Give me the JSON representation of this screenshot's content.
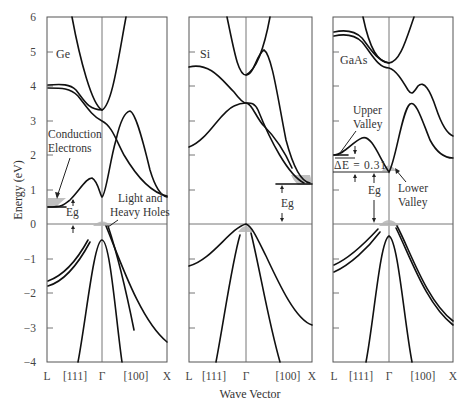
{
  "figure": {
    "y_axis_label": "Energy (eV)",
    "x_axis_label": "Wave Vector",
    "y_ticks": [
      "6",
      "5",
      "4",
      "3",
      "2",
      "1",
      "0",
      "−1",
      "−2",
      "−3",
      "−4"
    ],
    "panels": [
      {
        "material": "Ge",
        "x_ticks": [
          "L",
          "[111]",
          "Γ",
          "[100]",
          "X"
        ],
        "annotations": {
          "conduction_1": "Conduction",
          "conduction_2": "Electrons",
          "holes_1": "Light and",
          "holes_2": "Heavy Holes",
          "gap": "Eg"
        }
      },
      {
        "material": "Si",
        "x_ticks": [
          "L",
          "[111]",
          "Γ",
          "[100]",
          "X"
        ],
        "annotations": {
          "gap": "Eg"
        }
      },
      {
        "material": "GaAs",
        "x_ticks": [
          "L",
          "[111]",
          "Γ",
          "[100]",
          "X"
        ],
        "annotations": {
          "upper_1": "Upper",
          "upper_2": "Valley",
          "delta_e": "ΔE = 0.31",
          "gap": "Eg",
          "lower_1": "Lower",
          "lower_2": "Valley"
        }
      }
    ],
    "energy_range_eV": [
      -4,
      6
    ]
  }
}
